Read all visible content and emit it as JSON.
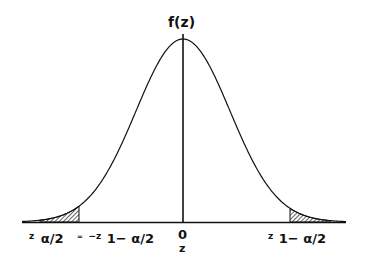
{
  "diagram": {
    "type": "normal-distribution-curve",
    "y_axis_label": "f(z)",
    "x_axis_label": "z",
    "origin_label": "0",
    "left_critical": {
      "var": "z",
      "subscript": "α/2",
      "equals_sign": "=",
      "neg_var": "−z",
      "neg_subscript": "1− α/2"
    },
    "right_critical": {
      "var": "z",
      "subscript": "1− α/2"
    },
    "shaded_tails": [
      "left",
      "right"
    ],
    "colors": {
      "line": "#111111",
      "background": "#ffffff",
      "hatch": "#111111"
    }
  }
}
